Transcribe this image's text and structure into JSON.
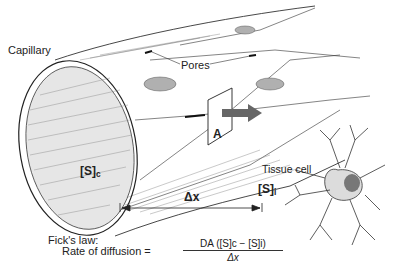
{
  "figure": {
    "labels": {
      "capillary": "Capillary",
      "pores": "Pores",
      "area": "A",
      "capillary_concentration": "[S]",
      "capillary_concentration_sub": "c",
      "tissue_concentration": "[S]",
      "tissue_concentration_sub": "i",
      "tissue_cell": "Tissue cell",
      "distance": "Δx"
    },
    "equation": {
      "title": "Fick's law:",
      "lhs": "Rate of diffusion =",
      "numerator": "DA ([S]c − [S]i)",
      "denominator": "Δx"
    }
  }
}
